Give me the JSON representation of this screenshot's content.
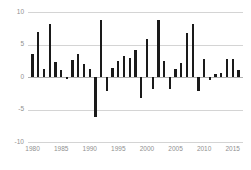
{
  "chart_data": {
    "type": "bar",
    "title": "",
    "subtitle": "",
    "xlabel": "",
    "ylabel": "",
    "xlim": [
      1979.2,
      2016.8
    ],
    "ylim": [
      -10,
      10
    ],
    "grid": true,
    "legend": null,
    "legend_position": "none",
    "bar_color": "#1a1a1a",
    "gridline_color": "#d4d4d4",
    "tick_label_color": "#909090",
    "yticks": [
      10,
      5,
      0,
      -5,
      -10
    ],
    "ytick_labels": [
      "10",
      "5",
      "0",
      "-5",
      "-10"
    ],
    "xticks": [
      1980,
      1985,
      1990,
      1995,
      2000,
      2005,
      2010,
      2015
    ],
    "xtick_labels": [
      "1980",
      "1985",
      "1990",
      "1995",
      "2000",
      "2005",
      "2010",
      "2015"
    ],
    "categories": [
      1980,
      1981,
      1982,
      1983,
      1984,
      1985,
      1986,
      1987,
      1988,
      1989,
      1990,
      1991,
      1992,
      1993,
      1994,
      1995,
      1996,
      1997,
      1998,
      1999,
      2000,
      2001,
      2002,
      2003,
      2004,
      2005,
      2006,
      2007,
      2008,
      2009,
      2010,
      2011,
      2012,
      2013,
      2014,
      2015,
      2016
    ],
    "values": [
      3.6,
      7.0,
      1.2,
      8.2,
      2.3,
      1.1,
      -0.3,
      2.6,
      3.5,
      2.0,
      1.2,
      -6.2,
      8.8,
      -2.2,
      1.4,
      2.4,
      3.2,
      2.9,
      4.2,
      -3.2,
      5.9,
      -1.8,
      8.7,
      2.4,
      -1.8,
      1.3,
      2.1,
      6.7,
      8.1,
      -2.1,
      2.7,
      -0.4,
      0.4,
      0.6,
      2.8,
      2.8,
      1.1
    ]
  }
}
